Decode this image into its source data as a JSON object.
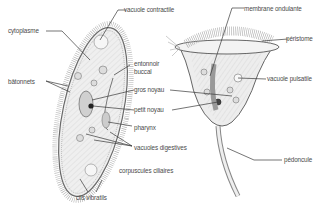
{
  "diagram": {
    "organisms": [
      {
        "name": "paramecium"
      },
      {
        "name": "vorticella"
      }
    ],
    "labels": {
      "cytoplasme": "cytoplasme",
      "vacuole_contractile": "vacuole contractile",
      "batonnets": "bâtonnets",
      "entonnoir_buccal_1": "entonnoir",
      "entonnoir_buccal_2": "buccal",
      "gros_noyau": "gros noyau",
      "petit_noyau": "petit noyau",
      "pharynx": "pharynx",
      "vacuoles_digestives": "vacuoles digestives",
      "corpuscules_ciliaires": "corpuscules ciliaires",
      "cils_vibratils": "cils vibratils",
      "membrane_ondulante": "membrane ondulante",
      "peristome": "péristome",
      "vacuole_pulsatile": "vacuole pulsatile",
      "pedoncule": "pédoncule"
    },
    "colors": {
      "line": "#3a3a3a",
      "body_fill": "#ececec",
      "cilia": "#9a9a9a",
      "text": "#4a4a4a"
    }
  }
}
